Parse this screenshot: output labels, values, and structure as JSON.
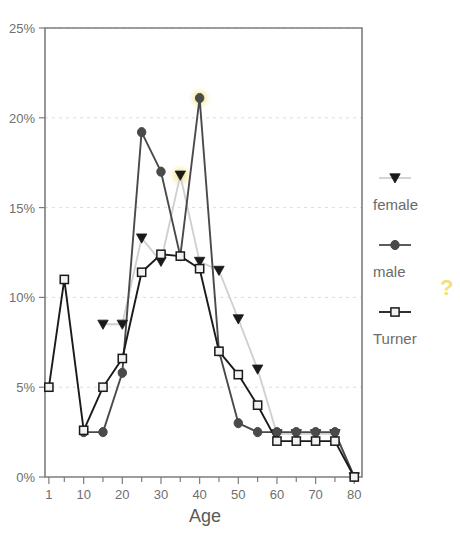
{
  "chart_data": {
    "type": "line",
    "title": "",
    "xlabel": "Age",
    "ylabel": "",
    "xlim": [
      0,
      82
    ],
    "ylim": [
      0,
      25
    ],
    "grid": true,
    "legend_position": "right",
    "x_ticks_labeled": [
      1,
      10,
      20,
      30,
      40,
      50,
      60,
      70,
      80
    ],
    "x_tick_labels": [
      "1",
      "10",
      "20",
      "30",
      "40",
      "50",
      "60",
      "70",
      "80"
    ],
    "x_ticks_minor": [
      5,
      15,
      25,
      35,
      45,
      55,
      65,
      75
    ],
    "y_ticks": [
      0,
      5,
      10,
      15,
      20,
      25
    ],
    "y_tick_labels": [
      "0%",
      "5%",
      "10%",
      "15%",
      "20%",
      "25%"
    ],
    "x": [
      1,
      5,
      10,
      15,
      20,
      25,
      30,
      35,
      40,
      45,
      50,
      55,
      60,
      65,
      70,
      75,
      80
    ],
    "series": [
      {
        "name": "female",
        "marker": "triangle-down",
        "color": "#1a1a1a",
        "line_color": "#d0d0d0",
        "values": [
          null,
          null,
          null,
          8.5,
          8.5,
          13.3,
          12.0,
          16.8,
          12.0,
          11.5,
          8.8,
          6.0,
          2.4,
          2.4,
          2.4,
          2.4,
          0.0
        ]
      },
      {
        "name": "male",
        "marker": "circle",
        "color": "#4a4a4a",
        "line_color": "#4a4a4a",
        "values": [
          null,
          null,
          2.5,
          2.5,
          5.8,
          19.2,
          17.0,
          12.3,
          21.1,
          7.0,
          3.0,
          2.5,
          2.5,
          2.5,
          2.5,
          2.5,
          0.0
        ]
      },
      {
        "name": "Turner",
        "marker": "square",
        "color": "#1a1a1a",
        "line_color": "#1a1a1a",
        "values": [
          5.0,
          11.0,
          2.6,
          5.0,
          6.6,
          11.4,
          12.4,
          12.3,
          11.6,
          7.0,
          5.7,
          4.0,
          2.0,
          2.0,
          2.0,
          2.0,
          0.0
        ]
      }
    ],
    "annotations": [
      {
        "name": "highlight-male-peak",
        "x": 40,
        "y": 21.1,
        "color": "#f5ea9a"
      },
      {
        "name": "highlight-female-peak",
        "x": 35,
        "y": 16.8,
        "color": "#f5ea9a"
      }
    ]
  },
  "legend": {
    "entries": [
      {
        "label": "female",
        "marker": "triangle-down-icon"
      },
      {
        "label": "male",
        "marker": "circle-icon"
      },
      {
        "label": "Turner",
        "marker": "square-icon"
      }
    ],
    "question_mark": "?"
  },
  "axis": {
    "x_title": "Age"
  }
}
